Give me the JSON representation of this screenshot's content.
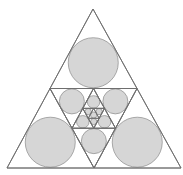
{
  "diagram": {
    "title": "",
    "outer_triangle": {
      "apex": [
        93,
        9
      ],
      "bottom_left": [
        7,
        168
      ],
      "bottom_right": [
        181,
        168
      ]
    },
    "recursion_depth": 4,
    "colors": {
      "background": "#ffffff",
      "stroke": "#6e6e6e",
      "circle_fill": "#d6d6d6",
      "circle_stroke": "#8a8a8a"
    },
    "stroke_width": 0.9
  }
}
